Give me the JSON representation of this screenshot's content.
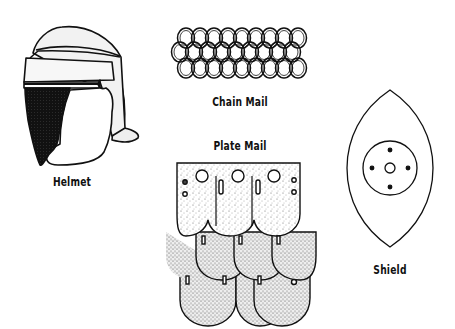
{
  "illustration": {
    "items": [
      {
        "name": "helmet",
        "label": "Helmet"
      },
      {
        "name": "chain-mail",
        "label": "Chain Mail"
      },
      {
        "name": "plate-mail",
        "label": "Plate Mail"
      },
      {
        "name": "shield",
        "label": "Shield"
      }
    ]
  }
}
